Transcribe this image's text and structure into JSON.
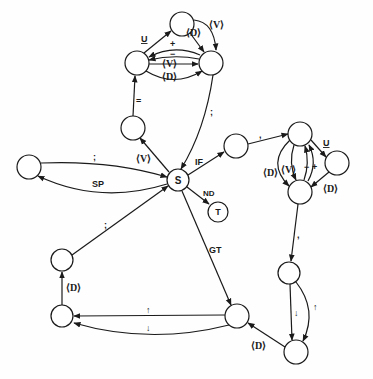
{
  "diagram": {
    "type": "state-transition-graph",
    "nodes": [
      {
        "id": "S",
        "label": "S",
        "x": 178,
        "y": 180,
        "r": 11
      },
      {
        "id": "T",
        "label": "T",
        "x": 218,
        "y": 212,
        "r": 10
      },
      {
        "id": "n_if",
        "label": "",
        "x": 236,
        "y": 146,
        "r": 12
      },
      {
        "id": "n_v",
        "label": "",
        "x": 133,
        "y": 128,
        "r": 12
      },
      {
        "id": "n_tl",
        "label": "",
        "x": 137,
        "y": 63,
        "r": 12
      },
      {
        "id": "n_tm",
        "label": "",
        "x": 182,
        "y": 24,
        "r": 12
      },
      {
        "id": "n_tr",
        "label": "",
        "x": 211,
        "y": 63,
        "r": 12
      },
      {
        "id": "n_sp",
        "label": "",
        "x": 29,
        "y": 167,
        "r": 12
      },
      {
        "id": "n_lu",
        "label": "",
        "x": 62,
        "y": 260,
        "r": 11
      },
      {
        "id": "n_ll",
        "label": "",
        "x": 62,
        "y": 316,
        "r": 11
      },
      {
        "id": "n_bm",
        "label": "",
        "x": 237,
        "y": 316,
        "r": 12
      },
      {
        "id": "n_rt",
        "label": "",
        "x": 300,
        "y": 134,
        "r": 12
      },
      {
        "id": "n_rr",
        "label": "",
        "x": 337,
        "y": 163,
        "r": 12
      },
      {
        "id": "n_rb",
        "label": "",
        "x": 300,
        "y": 192,
        "r": 12
      },
      {
        "id": "n_c1",
        "label": "",
        "x": 289,
        "y": 273,
        "r": 11
      },
      {
        "id": "n_c2",
        "label": "",
        "x": 296,
        "y": 352,
        "r": 12
      }
    ],
    "edges": [
      {
        "from": "S",
        "to": "n_v",
        "label": "⟨V⟩"
      },
      {
        "from": "n_v",
        "to": "n_tl",
        "label": "="
      },
      {
        "from": "n_tl",
        "to": "n_tm",
        "label": "U"
      },
      {
        "from": "n_tm",
        "to": "n_tr",
        "label": "⟨D⟩"
      },
      {
        "from": "n_tm",
        "to": "n_tr",
        "label": "⟨V⟩"
      },
      {
        "from": "n_tr",
        "to": "n_tl",
        "label": "+"
      },
      {
        "from": "n_tr",
        "to": "n_tl",
        "label": "−"
      },
      {
        "from": "n_tl",
        "to": "n_tr",
        "label": "⟨V⟩"
      },
      {
        "from": "n_tl",
        "to": "n_tr",
        "label": "⟨D⟩"
      },
      {
        "from": "n_tr",
        "to": "S",
        "label": ";"
      },
      {
        "from": "n_sp",
        "to": "S",
        "label": ";"
      },
      {
        "from": "S",
        "to": "n_sp",
        "label": "SP"
      },
      {
        "from": "S",
        "to": "n_if",
        "label": "IF"
      },
      {
        "from": "S",
        "to": "T",
        "label": "ND"
      },
      {
        "from": "S",
        "to": "n_bm",
        "label": "GT"
      },
      {
        "from": "n_lu",
        "to": "S",
        "label": ";"
      },
      {
        "from": "n_ll",
        "to": "n_lu",
        "label": "⟨D⟩"
      },
      {
        "from": "n_bm",
        "to": "n_ll",
        "label": "↑"
      },
      {
        "from": "n_bm",
        "to": "n_ll",
        "label": "↓"
      },
      {
        "from": "n_if",
        "to": "n_rt",
        "label": ","
      },
      {
        "from": "n_rt",
        "to": "n_rr",
        "label": "U"
      },
      {
        "from": "n_rr",
        "to": "n_rb",
        "label": "⟨D⟩"
      },
      {
        "from": "n_rt",
        "to": "n_rb",
        "label": "⟨D⟩"
      },
      {
        "from": "n_rt",
        "to": "n_rb",
        "label": "⟨V⟩"
      },
      {
        "from": "n_rb",
        "to": "n_rt",
        "label": "−"
      },
      {
        "from": "n_rb",
        "to": "n_rt",
        "label": "+"
      },
      {
        "from": "n_rb",
        "to": "n_c1",
        "label": ","
      },
      {
        "from": "n_c1",
        "to": "n_c2",
        "label": "↓"
      },
      {
        "from": "n_c1",
        "to": "n_c2",
        "label": "↑"
      },
      {
        "from": "n_c2",
        "to": "n_bm",
        "label": "⟨D⟩"
      }
    ]
  },
  "labels": {
    "S": "S",
    "T": "T",
    "V_sv": "⟨V⟩",
    "eq": "=",
    "U_top": "U",
    "D_top": "⟨D⟩",
    "V_top": "⟨V⟩",
    "plus_top": "+",
    "minus_top": "−",
    "V_mid": "⟨V⟩",
    "D_mid": "⟨D⟩",
    "semi_top": ";",
    "semi_sp": ";",
    "SP": "SP",
    "IF": "IF",
    "ND": "ND",
    "GT": "GT",
    "semi_left": ";",
    "D_left": "⟨D⟩",
    "up_bot": "↑",
    "down_bot": "↓",
    "comma_if": ",",
    "U_right": "U",
    "D_right": "⟨D⟩",
    "D_rloop": "⟨D⟩",
    "V_rloop": "⟨V⟩",
    "minus_r": "−",
    "plus_r": "+",
    "comma_r": ",",
    "down_chain": "↓",
    "up_chain": "↑",
    "D_chain": "⟨D⟩"
  }
}
